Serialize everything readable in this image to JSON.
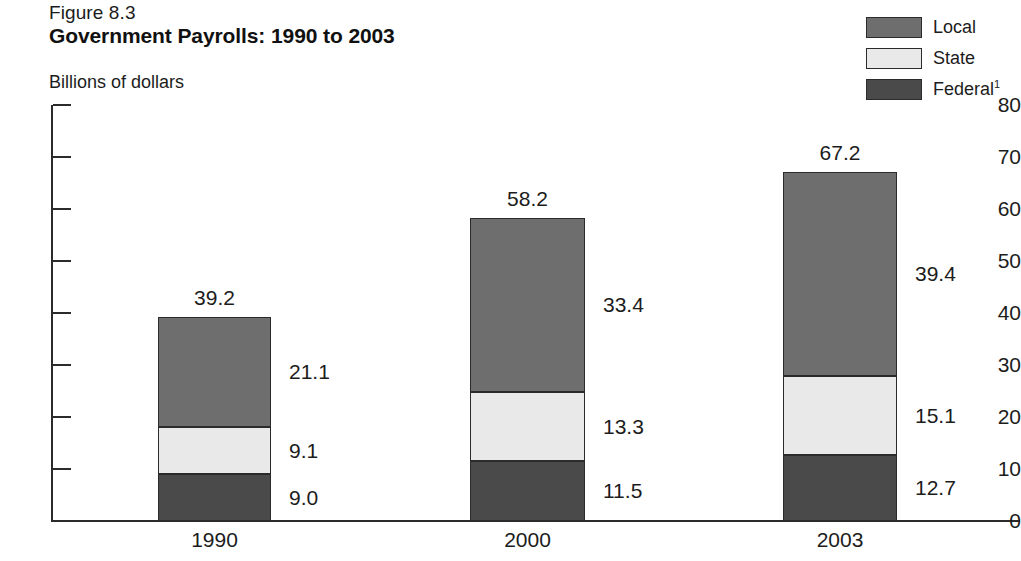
{
  "figure": {
    "label": "Figure 8.3",
    "title": "Government Payrolls: 1990 to 2003",
    "unit_label": "Billions of dollars"
  },
  "legend": {
    "items": [
      {
        "label": "Local",
        "color": "#6e6e6e",
        "footnote": ""
      },
      {
        "label": "State",
        "color": "#e9e9e9",
        "footnote": ""
      },
      {
        "label": "Federal",
        "color": "#4a4a4a",
        "footnote": "1"
      }
    ]
  },
  "axis": {
    "y_ticks": [
      "80",
      "70",
      "60",
      "50",
      "40",
      "30",
      "20",
      "10",
      "0"
    ],
    "x_labels": [
      "1990",
      "2000",
      "2003"
    ]
  },
  "bars": [
    {
      "category": "1990",
      "total": "39.2",
      "segments": [
        {
          "name": "Local",
          "value": "21.1"
        },
        {
          "name": "State",
          "value": "9.1"
        },
        {
          "name": "Federal",
          "value": "9.0"
        }
      ]
    },
    {
      "category": "2000",
      "total": "58.2",
      "segments": [
        {
          "name": "Local",
          "value": "33.4"
        },
        {
          "name": "State",
          "value": "13.3"
        },
        {
          "name": "Federal",
          "value": "11.5"
        }
      ]
    },
    {
      "category": "2003",
      "total": "67.2",
      "segments": [
        {
          "name": "Local",
          "value": "39.4"
        },
        {
          "name": "State",
          "value": "15.1"
        },
        {
          "name": "Federal",
          "value": "12.7"
        }
      ]
    }
  ],
  "chart_data": {
    "type": "bar",
    "subtype": "stacked-vertical",
    "title": "Government Payrolls: 1990 to 2003",
    "subtitle": "Figure 8.3",
    "xlabel": "",
    "ylabel": "Billions of dollars",
    "ylim": [
      0,
      80
    ],
    "ytick_step": 10,
    "yticks": [
      0,
      10,
      20,
      30,
      40,
      50,
      60,
      70,
      80
    ],
    "grid": false,
    "legend_position": "top-right",
    "categories": [
      "1990",
      "2000",
      "2003"
    ],
    "series": [
      {
        "name": "Federal",
        "values": [
          9.0,
          11.5,
          12.7
        ],
        "color": "#4a4a4a"
      },
      {
        "name": "State",
        "values": [
          9.1,
          13.3,
          15.1
        ],
        "color": "#e9e9e9"
      },
      {
        "name": "Local",
        "values": [
          21.1,
          33.4,
          39.4
        ],
        "color": "#6e6e6e"
      }
    ],
    "totals": [
      39.2,
      58.2,
      67.2
    ],
    "footnote_marker": "1",
    "units": "billions of dollars"
  }
}
